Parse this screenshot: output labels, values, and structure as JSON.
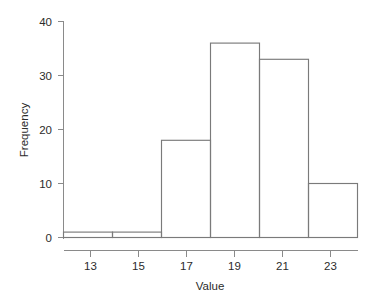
{
  "chart_data": {
    "type": "bar",
    "subtype": "histogram",
    "title": "",
    "xlabel": "Value",
    "ylabel": "Frequency",
    "categories": [
      "12-14",
      "14-16",
      "16-18",
      "18-20",
      "20-22",
      "22-24"
    ],
    "bin_edges": [
      12,
      14,
      16,
      18,
      20,
      22,
      24
    ],
    "bin_centers": [
      13,
      15,
      17,
      19,
      21,
      23
    ],
    "values": [
      1,
      1,
      18,
      36,
      33,
      10
    ],
    "xlim": [
      12,
      24
    ],
    "ylim": [
      0,
      40
    ],
    "xticks": [
      13,
      15,
      17,
      19,
      21,
      23
    ],
    "xtick_labels": [
      "13",
      "15",
      "17",
      "19",
      "21",
      "23"
    ],
    "yticks": [
      0,
      10,
      20,
      30,
      40
    ],
    "ytick_labels": [
      "0",
      "10",
      "20",
      "30",
      "40"
    ],
    "grid": false,
    "legend": false,
    "legend_position": "none",
    "bar_fill": "none",
    "bar_stroke": "#7a7a7a",
    "axis_color": "#8a8a8a",
    "background": "#ffffff",
    "text_color": "#2b2b2b"
  },
  "axes": {
    "x_title": "Value",
    "y_title": "Frequency"
  },
  "ytick_labels": {
    "t0": "0",
    "t1": "10",
    "t2": "20",
    "t3": "30",
    "t4": "40"
  },
  "xtick_labels": {
    "t0": "13",
    "t1": "15",
    "t2": "17",
    "t3": "19",
    "t4": "21",
    "t5": "23"
  }
}
